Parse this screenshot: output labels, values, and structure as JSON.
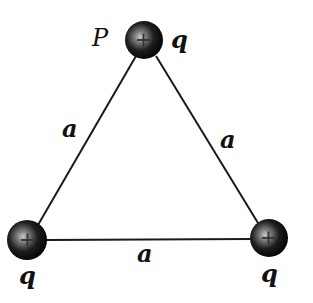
{
  "diagram": {
    "vertices": [
      {
        "id": "top",
        "point_label": "P",
        "charge_label": "q",
        "sign": "+"
      },
      {
        "id": "bottom-left",
        "charge_label": "q",
        "sign": "+"
      },
      {
        "id": "bottom-right",
        "charge_label": "q",
        "sign": "+"
      }
    ],
    "sides": [
      {
        "id": "left",
        "label": "a"
      },
      {
        "id": "right",
        "label": "a"
      },
      {
        "id": "bottom",
        "label": "a"
      }
    ],
    "colors": {
      "line": "#1a1a1a",
      "charge_dark": "#0d0d0d",
      "charge_highlight": "#bdbdbd",
      "background": "#ffffff"
    }
  }
}
